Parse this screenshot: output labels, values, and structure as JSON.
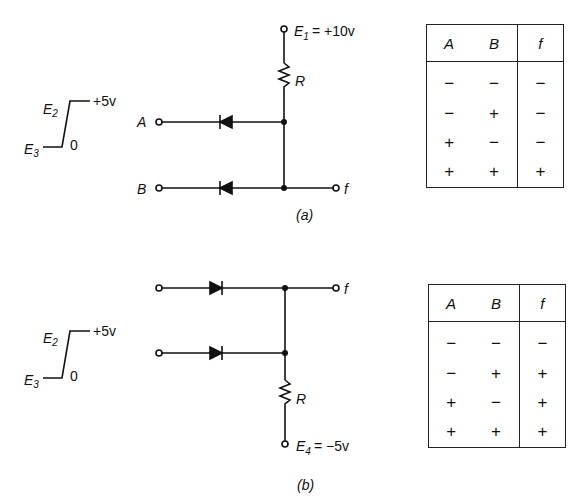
{
  "circuit_a": {
    "supply_label": "E",
    "supply_sub": "1",
    "supply_value": "= +10v",
    "resistor_label": "R",
    "input_a": "A",
    "input_b": "B",
    "output": "f",
    "caption": "(a)",
    "waveform": {
      "high_label": "E",
      "high_sub": "2",
      "high_value": "+5v",
      "low_label": "E",
      "low_sub": "3",
      "low_value": "0"
    },
    "truth_table": {
      "headers": [
        "A",
        "B",
        "f"
      ],
      "rows": [
        [
          "−",
          "−",
          "−"
        ],
        [
          "−",
          "+",
          "−"
        ],
        [
          "+",
          "−",
          "−"
        ],
        [
          "+",
          "+",
          "+"
        ]
      ]
    }
  },
  "circuit_b": {
    "supply_label": "E",
    "supply_sub": "4",
    "supply_value": "= −5v",
    "resistor_label": "R",
    "output": "f",
    "caption": "(b)",
    "waveform": {
      "high_label": "E",
      "high_sub": "2",
      "high_value": "+5v",
      "low_label": "E",
      "low_sub": "3",
      "low_value": "0"
    },
    "truth_table": {
      "headers": [
        "A",
        "B",
        "f"
      ],
      "rows": [
        [
          "−",
          "−",
          "−"
        ],
        [
          "−",
          "+",
          "+"
        ],
        [
          "+",
          "−",
          "+"
        ],
        [
          "+",
          "+",
          "+"
        ]
      ]
    }
  }
}
